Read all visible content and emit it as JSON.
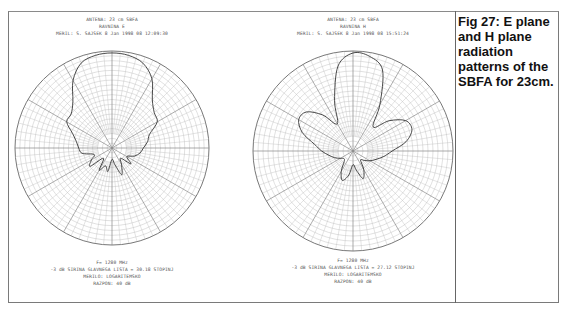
{
  "caption": "Fig 27: E plane and H plane radiation patterns of the SBFA for 23cm.",
  "plots": [
    {
      "header": [
        "ANTENA: 23 cm SBFA",
        "RAVNINA E",
        "MERIL: S. SAJSEK  8 Jan 1998 08 12:09:30"
      ],
      "footer": [
        "F= 1280 MHz",
        "-3 dB SIRINA GLAVNEGA LISTA = 30.18 STOPINJ",
        "MERILO: LOGARITEMSKO",
        "RAZPON: 40 dB"
      ]
    },
    {
      "header": [
        "ANTENA: 23 cm SBFA",
        "RAVNINA H",
        "MERIL: S. SAJSEK  8 Jan 1998 08 15:51:24"
      ],
      "footer": [
        "F= 1280 MHz",
        "-3 dB SIRINA GLAVNEGA LISTA = 27.12 STOPINJ",
        "MERILO: LOGARITEMSKO",
        "RAZPON: 40 dB"
      ]
    }
  ],
  "chart_data": [
    {
      "type": "polar",
      "title": "ANTENA: 23 cm SBFA — RAVNINA E",
      "frequency": "1280 MHz",
      "beamwidth_3dB_deg": 30.18,
      "scale": "logarithmic",
      "range_dB": 40,
      "grid": true,
      "angles_deg": [
        0,
        10,
        20,
        30,
        40,
        50,
        60,
        70,
        80,
        90,
        100,
        110,
        120,
        130,
        140,
        150,
        160,
        170,
        180,
        190,
        200,
        210,
        220,
        230,
        240,
        250,
        260,
        270,
        280,
        290,
        300,
        310,
        320,
        330,
        340,
        350
      ],
      "radius_norm": [
        1.0,
        0.99,
        0.95,
        0.84,
        0.66,
        0.58,
        0.55,
        0.42,
        0.38,
        0.33,
        0.3,
        0.25,
        0.18,
        0.26,
        0.14,
        0.2,
        0.3,
        0.18,
        0.12,
        0.25,
        0.2,
        0.27,
        0.14,
        0.3,
        0.25,
        0.2,
        0.32,
        0.35,
        0.38,
        0.44,
        0.55,
        0.56,
        0.64,
        0.82,
        0.95,
        0.99
      ]
    },
    {
      "type": "polar",
      "title": "ANTENA: 23 cm SBFA — RAVNINA H",
      "frequency": "1280 MHz",
      "beamwidth_3dB_deg": 27.12,
      "scale": "logarithmic",
      "range_dB": 40,
      "grid": true,
      "angles_deg": [
        0,
        10,
        20,
        30,
        40,
        50,
        60,
        70,
        80,
        90,
        100,
        110,
        120,
        130,
        140,
        150,
        160,
        170,
        180,
        190,
        200,
        210,
        220,
        230,
        240,
        250,
        260,
        270,
        280,
        290,
        300,
        310,
        320,
        330,
        340,
        350
      ],
      "radius_norm": [
        1.0,
        0.98,
        0.88,
        0.55,
        0.32,
        0.48,
        0.62,
        0.64,
        0.55,
        0.4,
        0.32,
        0.25,
        0.2,
        0.15,
        0.12,
        0.22,
        0.3,
        0.2,
        0.14,
        0.25,
        0.32,
        0.24,
        0.14,
        0.12,
        0.15,
        0.2,
        0.25,
        0.32,
        0.4,
        0.55,
        0.64,
        0.62,
        0.48,
        0.32,
        0.55,
        0.88
      ]
    }
  ]
}
